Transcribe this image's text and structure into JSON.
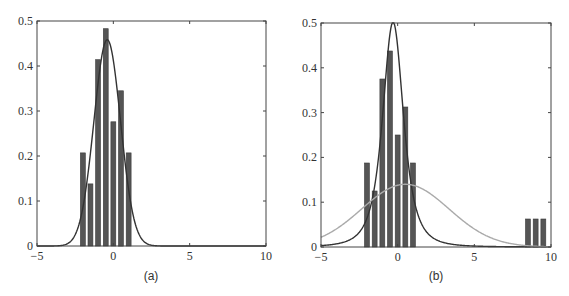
{
  "chart_data": [
    {
      "panel": "a",
      "type": "bar",
      "caption": "(a)",
      "xlim": [
        -5,
        10
      ],
      "ylim": [
        0,
        0.5
      ],
      "xticks": [
        -5,
        0,
        5,
        10
      ],
      "xtick_labels": [
        "−5",
        "0",
        "5",
        "10"
      ],
      "yticks": [
        0,
        0.1,
        0.2,
        0.3,
        0.4,
        0.5
      ],
      "ytick_labels": [
        "0",
        "0.1",
        "0.2",
        "0.3",
        "0.4",
        "0.5"
      ],
      "grid": false,
      "bar_width": 0.32,
      "bars": {
        "x": [
          -2,
          -1.5,
          -1,
          -0.5,
          0,
          0.5,
          1
        ],
        "values": [
          0.207,
          0.138,
          0.414,
          0.483,
          0.276,
          0.345,
          0.207
        ],
        "color": "#555555"
      },
      "curves": [
        {
          "name": "gaussian fit",
          "kind": "gaussian",
          "mean": -0.4,
          "sd": 0.87,
          "color": "#333333"
        }
      ]
    },
    {
      "panel": "b",
      "type": "bar",
      "caption": "(b)",
      "xlim": [
        -5,
        10
      ],
      "ylim": [
        0,
        0.5
      ],
      "xticks": [
        -5,
        0,
        5,
        10
      ],
      "xtick_labels": [
        "−5",
        "0",
        "5",
        "10"
      ],
      "yticks": [
        0,
        0.1,
        0.2,
        0.3,
        0.4,
        0.5
      ],
      "ytick_labels": [
        "0",
        "0.1",
        "0.2",
        "0.3",
        "0.4",
        "0.5"
      ],
      "grid": false,
      "bar_width": 0.32,
      "bars": {
        "x": [
          -2,
          -1.5,
          -1,
          -0.5,
          0,
          0.5,
          1,
          8.5,
          9,
          9.5
        ],
        "values": [
          0.1875,
          0.125,
          0.375,
          0.4375,
          0.25,
          0.3125,
          0.1875,
          0.0625,
          0.0625,
          0.0625
        ],
        "color": "#555555"
      },
      "curves": [
        {
          "name": "student-t fit",
          "kind": "student_t",
          "loc": -0.3,
          "scale": 0.72,
          "dof": 2.5,
          "color": "#333333"
        },
        {
          "name": "gaussian fit",
          "kind": "gaussian",
          "mean": 0.5,
          "sd": 2.85,
          "color": "#aaaaaa"
        }
      ]
    }
  ],
  "panels": [
    {
      "caption": "(a)",
      "box": {
        "left": 37,
        "top": 21,
        "right": 266,
        "bottom": 246
      }
    },
    {
      "caption": "(b)",
      "box": {
        "left": 321,
        "top": 23,
        "right": 551,
        "bottom": 247
      }
    }
  ]
}
